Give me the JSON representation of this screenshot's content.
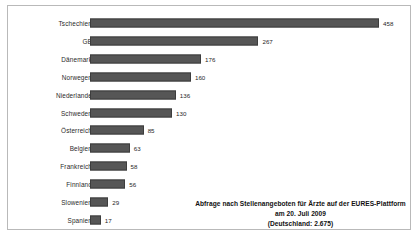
{
  "chart_data": {
    "type": "bar",
    "orientation": "horizontal",
    "title": "",
    "xlabel": "",
    "ylabel": "",
    "grid": false,
    "legend": null,
    "xlim": [
      0,
      458
    ],
    "categories": [
      "Tschechien",
      "GB",
      "Dänemark",
      "Norwegen",
      "Niederlande",
      "Schweden",
      "Österreich",
      "Belgien",
      "Frankreich",
      "Finnland",
      "Slowenien",
      "Spanien"
    ],
    "values": [
      458,
      267,
      176,
      160,
      136,
      130,
      85,
      63,
      58,
      56,
      29,
      17
    ],
    "value_labels": [
      "458",
      "267",
      "176",
      "160",
      "136",
      "130",
      "85",
      "63",
      "58",
      "56",
      "29",
      "17"
    ],
    "bar_color": "#565656",
    "annotation_line1": "Abfrage nach Stellenangeboten für Ärzte auf der EURES-Plattform am 20. Juli 2009",
    "annotation_line2": "(Deutschland: 2.675)"
  }
}
